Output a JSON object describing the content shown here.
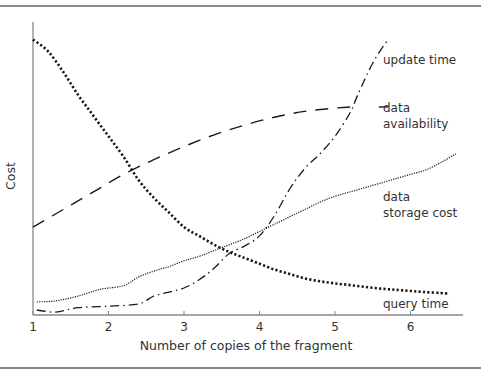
{
  "chart_data": {
    "type": "line",
    "title": "",
    "xlabel": "Number of copies of the fragment",
    "ylabel": "Cost",
    "xlim": [
      1,
      6.6
    ],
    "ylim": [
      0,
      100
    ],
    "grid": false,
    "x_ticks": [
      1,
      2,
      3,
      4,
      5,
      6
    ],
    "y_ticks": [],
    "legend": "inline labels at right end of each curve",
    "series": [
      {
        "name": "query time",
        "style": "heavy dotted",
        "points": [
          [
            1.0,
            94
          ],
          [
            1.2,
            90
          ],
          [
            1.4,
            83
          ],
          [
            1.6,
            75
          ],
          [
            1.8,
            68
          ],
          [
            2.0,
            61
          ],
          [
            2.2,
            54
          ],
          [
            2.4,
            46
          ],
          [
            2.6,
            40
          ],
          [
            2.8,
            35
          ],
          [
            3.0,
            30
          ],
          [
            3.2,
            27
          ],
          [
            3.4,
            24
          ],
          [
            3.6,
            21.5
          ],
          [
            3.8,
            19.5
          ],
          [
            4.0,
            17.5
          ],
          [
            4.2,
            15.5
          ],
          [
            4.4,
            14
          ],
          [
            4.6,
            12.5
          ],
          [
            4.8,
            11.5
          ],
          [
            5.0,
            10.8
          ],
          [
            5.2,
            10.2
          ],
          [
            5.4,
            9.6
          ],
          [
            5.6,
            9.0
          ],
          [
            5.8,
            8.6
          ],
          [
            6.0,
            8.2
          ],
          [
            6.2,
            7.8
          ],
          [
            6.4,
            7.5
          ],
          [
            6.5,
            7.3
          ]
        ]
      },
      {
        "name": "data availability",
        "style": "long dash",
        "points": [
          [
            1.0,
            30
          ],
          [
            1.4,
            36
          ],
          [
            1.8,
            42
          ],
          [
            2.2,
            48
          ],
          [
            2.6,
            53
          ],
          [
            3.0,
            57.5
          ],
          [
            3.4,
            61.5
          ],
          [
            3.8,
            64.8
          ],
          [
            4.2,
            67.5
          ],
          [
            4.6,
            69.5
          ],
          [
            5.0,
            70.6
          ],
          [
            5.2,
            71
          ],
          [
            5.3,
            71
          ],
          [
            5.7,
            71
          ]
        ]
      },
      {
        "name": "update time",
        "style": "dash-dot",
        "points": [
          [
            1.05,
            1.7
          ],
          [
            1.3,
            1.0
          ],
          [
            1.6,
            2.5
          ],
          [
            2.0,
            3.0
          ],
          [
            2.4,
            3.8
          ],
          [
            2.6,
            6.5
          ],
          [
            2.8,
            7.8
          ],
          [
            3.0,
            9.2
          ],
          [
            3.2,
            12
          ],
          [
            3.4,
            16
          ],
          [
            3.6,
            21
          ],
          [
            3.8,
            23.5
          ],
          [
            4.0,
            27
          ],
          [
            4.2,
            34
          ],
          [
            4.4,
            43
          ],
          [
            4.6,
            50
          ],
          [
            4.8,
            55
          ],
          [
            5.0,
            61
          ],
          [
            5.2,
            69
          ],
          [
            5.3,
            75
          ],
          [
            5.5,
            86
          ],
          [
            5.7,
            94
          ]
        ]
      },
      {
        "name": "data storage cost",
        "style": "fine dotted",
        "points": [
          [
            1.05,
            4.5
          ],
          [
            1.3,
            4.8
          ],
          [
            1.6,
            6.5
          ],
          [
            1.9,
            8.8
          ],
          [
            2.2,
            10
          ],
          [
            2.4,
            13
          ],
          [
            2.6,
            15
          ],
          [
            2.8,
            16.5
          ],
          [
            3.0,
            18.5
          ],
          [
            3.2,
            20
          ],
          [
            3.4,
            22
          ],
          [
            3.6,
            24
          ],
          [
            3.8,
            26
          ],
          [
            4.0,
            28.5
          ],
          [
            4.2,
            31
          ],
          [
            4.4,
            33.5
          ],
          [
            4.6,
            36
          ],
          [
            4.8,
            38.5
          ],
          [
            5.0,
            40.5
          ],
          [
            5.2,
            42
          ],
          [
            5.4,
            43.5
          ],
          [
            5.6,
            45
          ],
          [
            5.8,
            46.5
          ],
          [
            6.0,
            48
          ],
          [
            6.2,
            49.5
          ],
          [
            6.4,
            52
          ],
          [
            6.6,
            55
          ]
        ]
      }
    ],
    "annotations": [
      {
        "text": "update time",
        "x": 5.8,
        "y": 86
      },
      {
        "text": "data\navailability",
        "x": 5.8,
        "y": 70
      },
      {
        "text": "data\nstorage cost",
        "x": 5.8,
        "y": 42
      },
      {
        "text": "query time",
        "x": 5.8,
        "y": 3
      }
    ]
  },
  "axes": {
    "xlabel": "Number of copies of the fragment",
    "ylabel": "Cost",
    "x_tick_labels": [
      "1",
      "2",
      "3",
      "4",
      "5",
      "6"
    ]
  },
  "labels": {
    "update_time": "update time",
    "data_availability": "data\navailability",
    "data_storage_cost": "data\nstorage cost",
    "query_time": "query time"
  },
  "colors": {
    "line": "#1a1a1a",
    "axis": "#888888",
    "text": "#333333"
  }
}
